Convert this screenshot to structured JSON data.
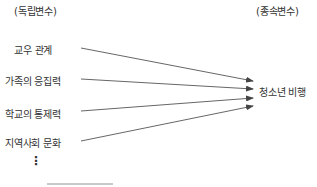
{
  "diagram": {
    "independent_header": "(독립변수)",
    "dependent_header": "(종속변수)",
    "independent_variables": [
      {
        "label": "교우 관계"
      },
      {
        "label": "가족의 응집력"
      },
      {
        "label": "학교의 통제력"
      },
      {
        "label": "지역사회 문화"
      }
    ],
    "ellipsis": "⋮",
    "dependent_variable": "청소년 비행",
    "colors": {
      "text": "#333333",
      "arrow": "#444444"
    }
  }
}
